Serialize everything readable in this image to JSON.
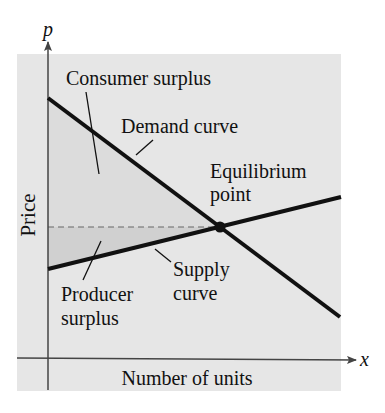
{
  "figure": {
    "axis_y_var": "p",
    "axis_x_var": "x",
    "ylabel": "Price",
    "xlabel": "Number of units",
    "labels": {
      "consumer_surplus": "Consumer surplus",
      "demand_curve": "Demand curve",
      "equilibrium_line1": "Equilibrium",
      "equilibrium_line2": "point",
      "supply_line1": "Supply",
      "supply_line2": "curve",
      "producer_line1": "Producer",
      "producer_line2": "surplus"
    },
    "colors": {
      "panel": "#e6e6e6",
      "consumer_fill": "#d9d9d9",
      "producer_fill": "#d2d2d2",
      "curve": "#111111",
      "axis": "#444444"
    }
  }
}
